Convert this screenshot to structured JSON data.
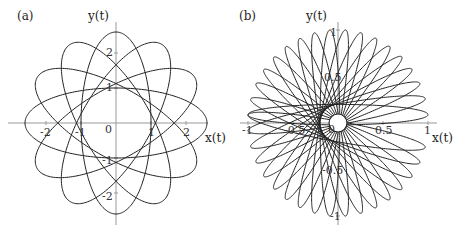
{
  "chart_data": [
    {
      "type": "line",
      "panel_label": "(a)",
      "title": "",
      "xlabel": "x(t)",
      "ylabel": "y(t)",
      "xlim": [
        -2.7,
        2.7
      ],
      "ylim": [
        -2.9,
        2.8
      ],
      "x_ticks": [
        "-2",
        "-1",
        "0",
        "1",
        "2"
      ],
      "y_ticks": [
        "2",
        "1",
        "-1",
        "-2"
      ],
      "grid": false,
      "curve": {
        "description": "rosette of rotated ellipses centered at origin",
        "ellipse_count": 6,
        "semi_major": 2.6,
        "semi_minor": 1.0,
        "rotation_step_deg": 30
      }
    },
    {
      "type": "line",
      "panel_label": "(b)",
      "title": "",
      "xlabel": "x(t)",
      "ylabel": "y(t)",
      "xlim": [
        -1.1,
        1.1
      ],
      "ylim": [
        -1.1,
        1.1
      ],
      "x_ticks": [
        "-1",
        "-0.5",
        "0",
        "0.5",
        "1"
      ],
      "y_ticks": [
        "1",
        "0.5",
        "-0.5",
        "-1"
      ],
      "grid": false,
      "curve": {
        "description": "rosette of thin rotated ellipses forming a flower with small inner circle",
        "ellipse_count": 18,
        "semi_major": 1.0,
        "semi_minor": 0.11,
        "rotation_step_deg": 10
      }
    }
  ],
  "panels": {
    "a": {
      "label": "(a)",
      "xlabel": "x(t)",
      "ylabel": "y(t)",
      "ticks_x": [
        "-2",
        "-1",
        "0",
        "1",
        "2"
      ],
      "ticks_y": [
        "2",
        "1",
        "-1",
        "-2"
      ]
    },
    "b": {
      "label": "(b)",
      "xlabel": "x(t)",
      "ylabel": "y(t)",
      "ticks_x": [
        "-1",
        "-0.5",
        "0",
        "0.5",
        "1"
      ],
      "ticks_y": [
        "1",
        "0.5",
        "-0.5",
        "-1"
      ]
    }
  }
}
